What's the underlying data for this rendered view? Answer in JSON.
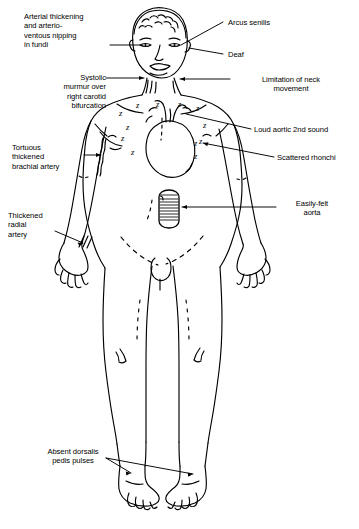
{
  "figure": {
    "style": "black ink line drawing on white background",
    "background_color": "#ffffff",
    "line_color": "#000000"
  },
  "labels": [
    {
      "id": "arterial-thickening",
      "text": "Arterial thickening\nand arterio-\nventous nipping\nin fundi",
      "lines": [
        "Arterial thickening",
        "and arterio-",
        "venous nipping",
        "in fundi"
      ],
      "align": "left",
      "side": "left",
      "target": "eye / ocular fundus",
      "leader": "horizontal line to right eye"
    },
    {
      "id": "systolic-murmur",
      "text": "Systolic\nmurmur over\nright carotid\nbifurcation",
      "lines": [
        "Systolic",
        "murmur over",
        "right carotid",
        "bifurcation"
      ],
      "align": "right",
      "side": "left",
      "target": "right carotid bifurcation in neck",
      "leader": "horizontal arrow to neck"
    },
    {
      "id": "tortuous-brachial",
      "text": "Tortuous\nthickened\nbrachial artery",
      "lines": [
        "Tortuous",
        "thickened",
        "brachial artery"
      ],
      "align": "left",
      "side": "left",
      "target": "upper arm brachial artery",
      "leader": "horizontal arrow to wavy artery"
    },
    {
      "id": "thickened-radial",
      "text": "Thickened\nradial\nartery",
      "lines": [
        "Thickened",
        "radial",
        "artery"
      ],
      "align": "left",
      "side": "left",
      "target": "wrist radial artery",
      "leader": "diagonal arrow to wrist hatching"
    },
    {
      "id": "absent-dorsalis",
      "text": "Absent dorsalis\npedis pulses",
      "lines": [
        "Absent dorsalis",
        "pedis pulses"
      ],
      "align": "center",
      "side": "left",
      "target": "dorsum of both feet",
      "leader": "two diagonal arrows to both ankles"
    },
    {
      "id": "arcus-senilis",
      "text": "Arcus senilis",
      "lines": [
        "Arcus senilis"
      ],
      "align": "left",
      "side": "right",
      "target": "cornea / eye",
      "leader": "diagonal line to left eye"
    },
    {
      "id": "deaf",
      "text": "Deaf",
      "lines": [
        "Deaf"
      ],
      "align": "left",
      "side": "right",
      "target": "ear",
      "leader": "horizontal line to ear"
    },
    {
      "id": "limitation-neck",
      "text": "Limitation of neck\nmovement",
      "lines": [
        "Limitation of neck",
        "movement"
      ],
      "align": "center",
      "side": "right",
      "target": "neck",
      "leader": "horizontal arrow to neck"
    },
    {
      "id": "loud-aortic-2nd",
      "text": "Loud aortic 2nd sound",
      "lines": [
        "Loud aortic 2nd sound"
      ],
      "align": "left",
      "side": "right",
      "target": "aortic area of chest",
      "leader": "diagonal line to upper chest"
    },
    {
      "id": "scattered-rhonchi",
      "text": "Scattered rhonchi",
      "lines": [
        "Scattered rhonchi"
      ],
      "align": "left",
      "side": "right",
      "target": "lung fields marked with Z symbols",
      "leader": "diagonal arrow to chest"
    },
    {
      "id": "easily-felt-aorta",
      "text": "Easily-felt\naorta",
      "lines": [
        "Easily-felt",
        "aorta"
      ],
      "align": "center",
      "side": "right",
      "target": "abdominal aorta",
      "leader": "horizontal arrow to abdominal aorta"
    }
  ],
  "rhonchi_marks": {
    "symbol": "z",
    "meaning": "scattered rhonchi over lung fields",
    "count": 12
  },
  "anatomy_features": [
    {
      "name": "heart",
      "note": "outlined heart with great vessels in left chest"
    },
    {
      "name": "abdominal-aorta",
      "note": "hatched vertical tube in upper abdomen"
    },
    {
      "name": "brachial-artery",
      "note": "wavy tortuous line on right upper arm"
    },
    {
      "name": "radial-artery",
      "note": "three short hatch strokes at right wrist"
    }
  ]
}
